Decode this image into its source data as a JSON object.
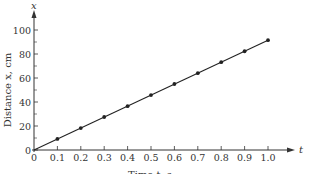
{
  "chart_data": {
    "type": "line",
    "title": "",
    "xlabel": "Time t, s",
    "ylabel": "Distance x, cm",
    "x_axis_symbol": "t",
    "y_axis_symbol": "x",
    "xlim": [
      0,
      1.0
    ],
    "ylim": [
      0,
      100
    ],
    "x_ticks": [
      0,
      0.1,
      0.2,
      0.3,
      0.4,
      0.5,
      0.6,
      0.7,
      0.8,
      0.9,
      1.0
    ],
    "x_tick_labels": [
      "0",
      "0.1",
      "0.2",
      "0.3",
      "0.4",
      "0.5",
      "0.6",
      "0.7",
      "0.8",
      "0.9",
      "1.0"
    ],
    "y_ticks": [
      0,
      20,
      40,
      60,
      80,
      100
    ],
    "y_tick_labels": [
      "0",
      "20",
      "40",
      "60",
      "80",
      "100"
    ],
    "y_minor_ticks": [
      10,
      30,
      50,
      70,
      90
    ],
    "grid": false,
    "legend": null,
    "series": [
      {
        "name": "Distance vs time",
        "x": [
          0,
          0.1,
          0.2,
          0.3,
          0.4,
          0.5,
          0.6,
          0.7,
          0.8,
          0.9,
          1.0
        ],
        "values": [
          0,
          9.2,
          18.3,
          27.5,
          36.5,
          45.8,
          55.0,
          64.0,
          73.2,
          82.3,
          91.5
        ],
        "marker": "dot",
        "line": "solid",
        "color": "#222222"
      }
    ]
  },
  "layout": {
    "origin_px": [
      34,
      150
    ],
    "x_px_per_unit": 234,
    "y_px_per_unit": 1.2,
    "x_axis_end_px": 295,
    "y_axis_top_px": 10
  }
}
